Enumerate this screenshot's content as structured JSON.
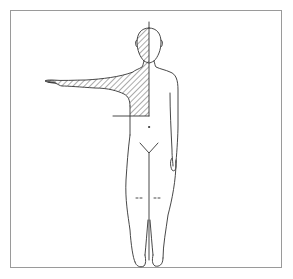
{
  "diagram": {
    "type": "body-region-diagram",
    "view": "anterior",
    "figure": "standing-human",
    "pose": "right-arm-extended-horizontally",
    "shaded_region": {
      "name": "right-upper-quadrant",
      "includes": [
        "right half of head",
        "right neck",
        "right upper torso",
        "right arm"
      ],
      "pattern": "diagonal-hatching"
    },
    "reference_lines": [
      {
        "name": "midline",
        "orientation": "vertical"
      },
      {
        "name": "horizontal-boundary",
        "orientation": "horizontal"
      }
    ],
    "colors": {
      "line": "#333333",
      "frame": "#9a9a9a",
      "hatch": "#444444",
      "background": "#ffffff"
    }
  }
}
